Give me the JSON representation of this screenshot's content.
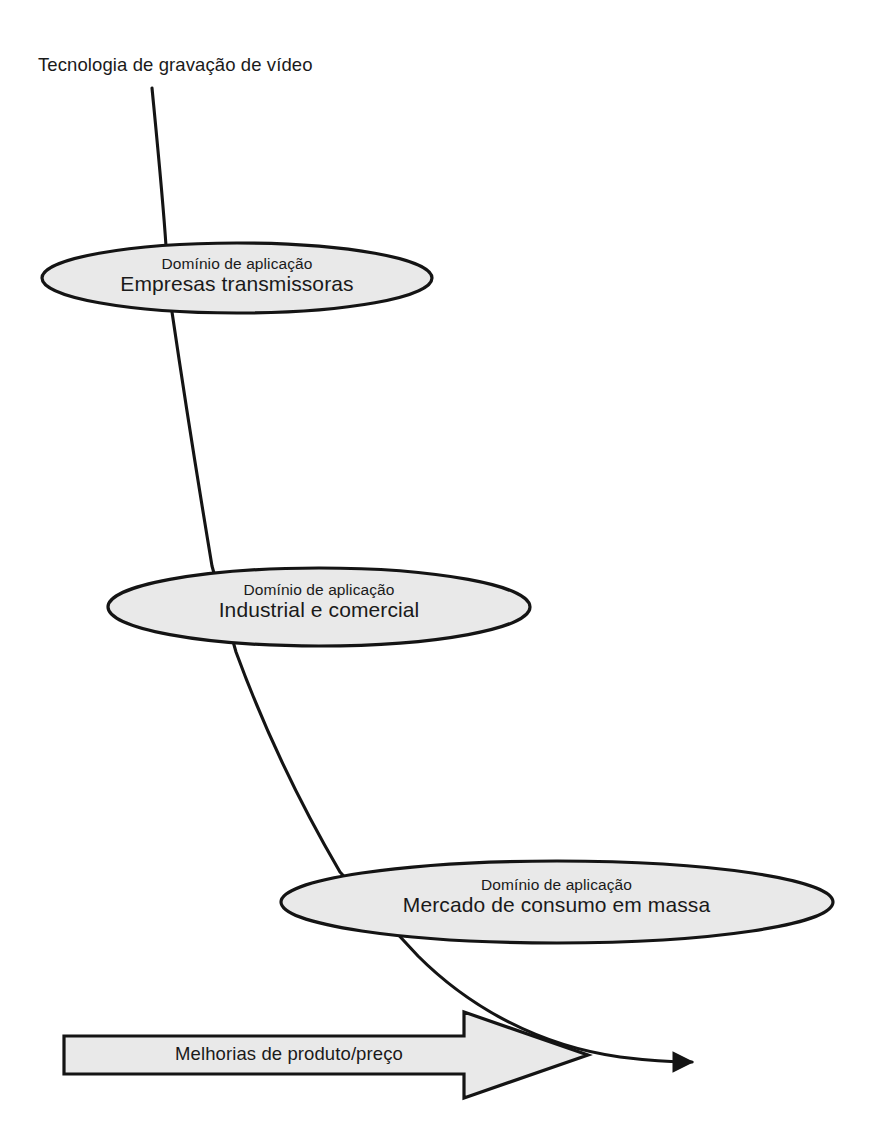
{
  "diagram": {
    "title": "Tecnologia de gravação de vídeo",
    "root_label": "Tecnologia de gravação de vídeo",
    "colors": {
      "node_fill": "#e9e9e9",
      "node_stroke": "#141414",
      "band_fill": "#e9e9e9",
      "band_stroke": "#141414",
      "line": "#141414",
      "text": "#1a1a1a",
      "background": "#ffffff"
    },
    "nodes": [
      {
        "id": "node-broadcast",
        "caption": "Domínio de aplicação",
        "label": "Empresas transmissoras"
      },
      {
        "id": "node-industrial",
        "caption": "Domínio de aplicação",
        "label": "Industrial e comercial"
      },
      {
        "id": "node-mass-market",
        "caption": "Domínio de aplicação",
        "label": "Mercado de consumo em massa"
      }
    ],
    "band_arrow": {
      "label": "Melhorias de produto/preço"
    }
  }
}
